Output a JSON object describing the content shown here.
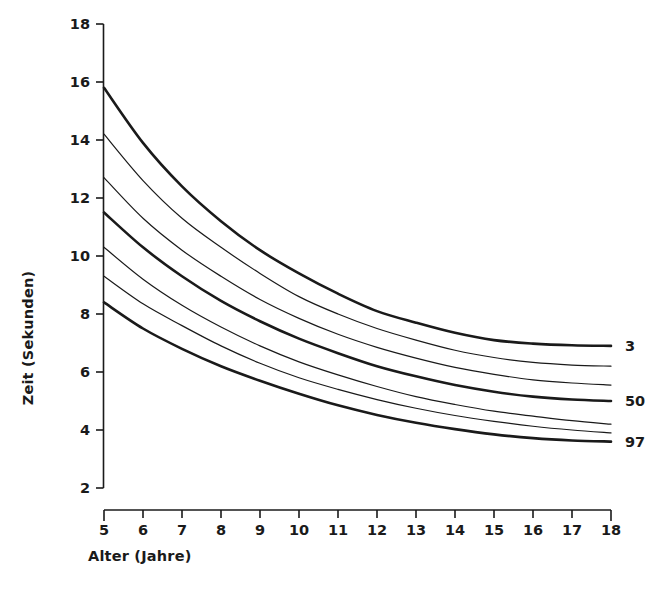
{
  "chart_data": {
    "type": "line",
    "title": "",
    "subtitle": "",
    "xlabel": "Alter (Jahre)",
    "ylabel": "Zeit (Sekunden)",
    "xlim": [
      5,
      18
    ],
    "ylim": [
      2,
      18
    ],
    "xticks": [
      5,
      6,
      7,
      8,
      9,
      10,
      11,
      12,
      13,
      14,
      15,
      16,
      17,
      18
    ],
    "yticks": [
      2,
      4,
      6,
      8,
      10,
      12,
      14,
      16,
      18
    ],
    "xtick_labels": [
      "5",
      "6",
      "7",
      "8",
      "9",
      "10",
      "11",
      "12",
      "13",
      "14",
      "15",
      "16",
      "17",
      "18"
    ],
    "ytick_labels": [
      "2",
      "4",
      "6",
      "8",
      "10",
      "12",
      "14",
      "16",
      "18"
    ],
    "grid": false,
    "legend": "curve-end-labels-right",
    "annotations": [
      {
        "text": "3",
        "series": "P3",
        "x": 18,
        "y": 6.9
      },
      {
        "text": "50",
        "series": "P50",
        "x": 18,
        "y": 5.0
      },
      {
        "text": "97",
        "series": "P97",
        "x": 18,
        "y": 3.6
      }
    ],
    "x": [
      5,
      6,
      7,
      8,
      9,
      10,
      11,
      12,
      13,
      14,
      15,
      16,
      17,
      18
    ],
    "series": [
      {
        "name": "P3",
        "label": "3",
        "emphasis": "thick",
        "values": [
          15.8,
          13.9,
          12.4,
          11.2,
          10.2,
          9.4,
          8.7,
          8.1,
          7.7,
          7.35,
          7.1,
          6.98,
          6.92,
          6.9
        ]
      },
      {
        "name": "P10",
        "label": "",
        "emphasis": "thin",
        "values": [
          14.2,
          12.6,
          11.3,
          10.3,
          9.4,
          8.6,
          8.0,
          7.5,
          7.1,
          6.75,
          6.5,
          6.33,
          6.24,
          6.2
        ]
      },
      {
        "name": "P25",
        "label": "",
        "emphasis": "thin",
        "values": [
          12.7,
          11.3,
          10.2,
          9.3,
          8.5,
          7.85,
          7.3,
          6.85,
          6.48,
          6.16,
          5.92,
          5.73,
          5.62,
          5.55
        ]
      },
      {
        "name": "P50",
        "label": "50",
        "emphasis": "thick",
        "values": [
          11.5,
          10.3,
          9.3,
          8.45,
          7.75,
          7.15,
          6.65,
          6.2,
          5.85,
          5.55,
          5.32,
          5.15,
          5.05,
          5.0
        ]
      },
      {
        "name": "P75",
        "label": "",
        "emphasis": "thin",
        "values": [
          10.3,
          9.2,
          8.3,
          7.55,
          6.9,
          6.35,
          5.9,
          5.5,
          5.15,
          4.88,
          4.65,
          4.48,
          4.32,
          4.2
        ]
      },
      {
        "name": "P90",
        "label": "",
        "emphasis": "thin",
        "values": [
          9.3,
          8.35,
          7.6,
          6.9,
          6.3,
          5.8,
          5.4,
          5.05,
          4.75,
          4.5,
          4.3,
          4.13,
          4.0,
          3.9
        ]
      },
      {
        "name": "P97",
        "label": "97",
        "emphasis": "thick",
        "values": [
          8.4,
          7.5,
          6.8,
          6.2,
          5.7,
          5.25,
          4.85,
          4.52,
          4.25,
          4.03,
          3.85,
          3.72,
          3.64,
          3.6
        ]
      }
    ],
    "colors": {
      "axis": "#1a1a1a",
      "curve": "#1a1a1a",
      "background": "#ffffff"
    },
    "line_widths": {
      "thick": 2.6,
      "thin": 1.2
    }
  }
}
